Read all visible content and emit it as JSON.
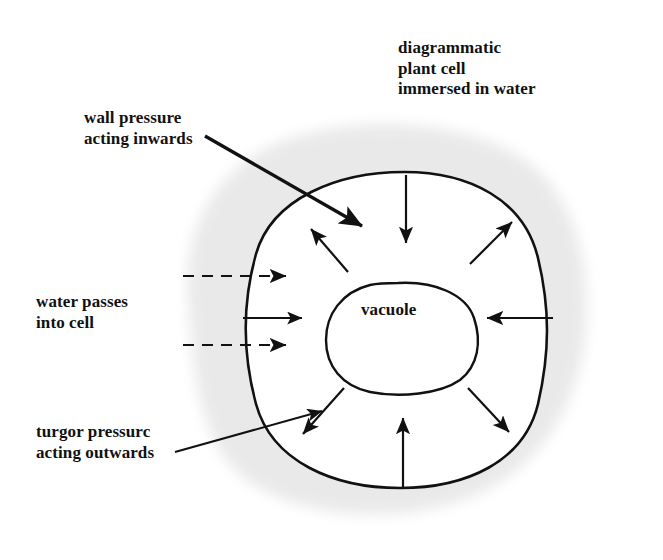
{
  "figure": {
    "title": "diagrammatic\nplant cell\nimmersed in water",
    "labels": {
      "wall_pressure": "wall pressure\nacting inwards",
      "water_passes": "water passes\ninto cell",
      "turgor_pressure": "turgor pressurc\nacting outwards",
      "vacuole": "vacuole"
    },
    "colors": {
      "ink": "#111111",
      "water_halo": "#e9e9e9",
      "cell_interior": "#ffffff",
      "background": "#ffffff"
    },
    "structures": [
      {
        "name": "water-halo",
        "shape": "soft blob",
        "fill": "#e9e9e9"
      },
      {
        "name": "cell-wall",
        "shape": "rounded square",
        "stroke": "#111111"
      },
      {
        "name": "vacuole",
        "shape": "irregular oval",
        "stroke": "#111111"
      }
    ],
    "arrows": {
      "wall_pressure_inward": [
        {
          "name": "top-centre",
          "direction": "down"
        },
        {
          "name": "right-middle",
          "direction": "left"
        },
        {
          "name": "bottom-centre",
          "direction": "up"
        }
      ],
      "turgor_outward": [
        {
          "name": "upper-left-diagonal",
          "direction": "up-left"
        },
        {
          "name": "upper-right-diagonal",
          "direction": "up-right"
        },
        {
          "name": "lower-left-diagonal",
          "direction": "down-left"
        },
        {
          "name": "lower-right-diagonal",
          "direction": "down-right"
        }
      ],
      "water_entry": [
        {
          "name": "water-arrow-upper",
          "style": "dashed",
          "direction": "right"
        },
        {
          "name": "water-arrow-middle",
          "style": "solid",
          "direction": "right"
        },
        {
          "name": "water-arrow-lower",
          "style": "dashed",
          "direction": "right"
        }
      ]
    }
  }
}
